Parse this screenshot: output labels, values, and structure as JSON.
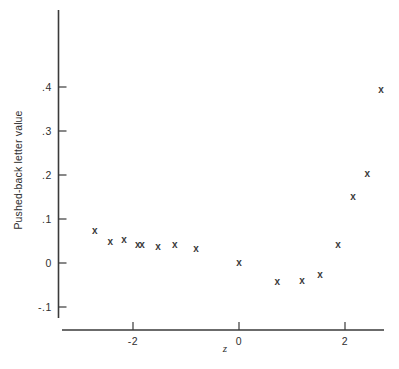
{
  "chart_data": {
    "type": "scatter",
    "title": "",
    "xlabel": "z",
    "ylabel": "Pushed-back letter value",
    "xlim": [
      -3.33,
      2.74
    ],
    "ylim": [
      -0.145,
      0.45
    ],
    "grid": false,
    "legend": null,
    "marker": "x",
    "marker_color": "#3a3a3a",
    "xticks": [
      -2,
      0,
      2
    ],
    "xtick_labels": [
      "-2",
      "0",
      "2"
    ],
    "yticks": [
      -0.1,
      0,
      0.1,
      0.2,
      0.3,
      0.4
    ],
    "ytick_labels": [
      "-.1",
      "0",
      ".1",
      ".2",
      ".3",
      ".4"
    ],
    "points": [
      {
        "x": -2.72,
        "y": 0.071
      },
      {
        "x": -2.43,
        "y": 0.046
      },
      {
        "x": -2.17,
        "y": 0.051
      },
      {
        "x": -1.91,
        "y": 0.041
      },
      {
        "x": -1.83,
        "y": 0.039
      },
      {
        "x": -1.53,
        "y": 0.035
      },
      {
        "x": -1.21,
        "y": 0.041
      },
      {
        "x": -0.81,
        "y": 0.032
      },
      {
        "x": 0.0,
        "y": 0.0
      },
      {
        "x": 0.72,
        "y": -0.045
      },
      {
        "x": 1.19,
        "y": -0.041
      },
      {
        "x": 1.53,
        "y": -0.027
      },
      {
        "x": 1.87,
        "y": 0.041
      },
      {
        "x": 2.15,
        "y": 0.15
      },
      {
        "x": 2.42,
        "y": 0.202
      },
      {
        "x": 2.68,
        "y": 0.393
      }
    ]
  },
  "axes": {
    "x_axis_name": "horizontal-axis",
    "y_axis_name": "vertical-axis"
  }
}
